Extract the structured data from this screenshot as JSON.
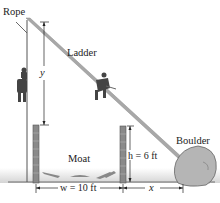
{
  "diagram": {
    "labels": {
      "rope": "Rope",
      "ladder": "Ladder",
      "boulder": "Boulder",
      "moat": "Moat",
      "y_var": "y",
      "h_dim": "h = 6 ft",
      "w_dim": "w = 10 ft",
      "x_var": "x"
    },
    "colors": {
      "ladder": "#a8a8a8",
      "post": "#8a8a8a",
      "ground_shade": "#d9d9d9",
      "boulder": "#b5b5b5",
      "line": "#222222"
    }
  }
}
